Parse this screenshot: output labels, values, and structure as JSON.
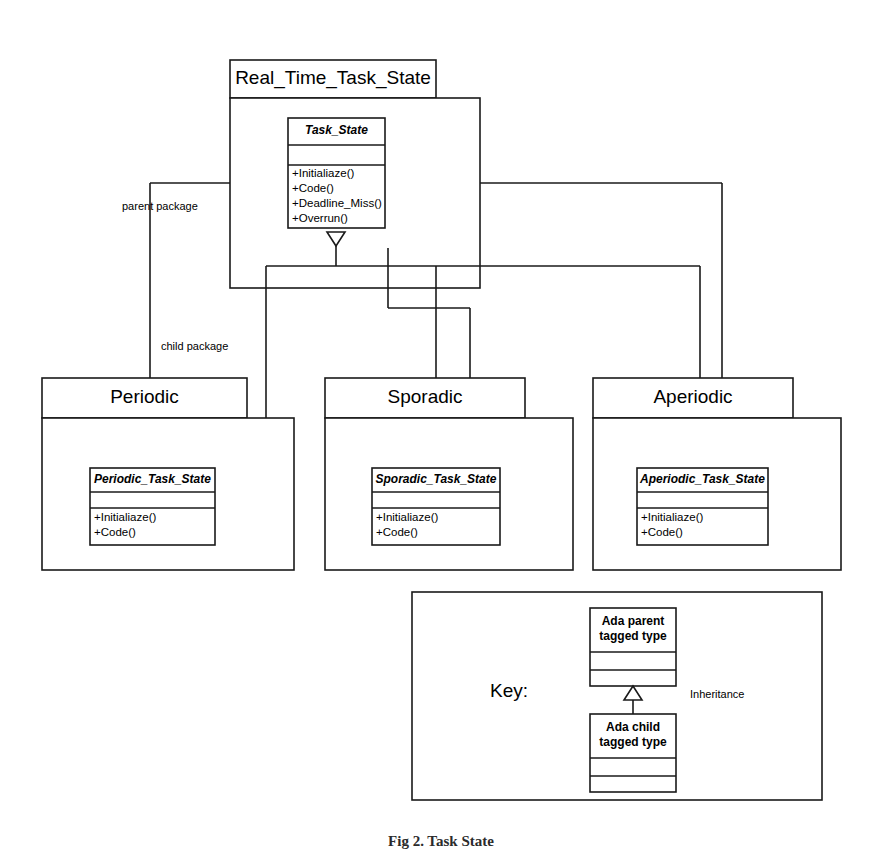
{
  "diagram": {
    "type": "uml-package-class-diagram",
    "caption": "Fig 2. Task State",
    "stroke_color": "#1a1a1a",
    "fill_color": "#ffffff"
  },
  "root_package": {
    "name": "Real_Time_Task_State",
    "classes": [
      {
        "name": "Task_State",
        "attributes": [],
        "operations": [
          "+Initialiaze()",
          "+Code()",
          "+Deadline_Miss()",
          "+Overrun()"
        ]
      }
    ]
  },
  "child_packages": [
    {
      "name": "Periodic",
      "classes": [
        {
          "name": "Periodic_Task_State",
          "attributes": [],
          "operations": [
            "+Initialiaze()",
            "+Code()"
          ]
        }
      ]
    },
    {
      "name": "Sporadic",
      "classes": [
        {
          "name": "Sporadic_Task_State",
          "attributes": [],
          "operations": [
            "+Initialiaze()",
            "+Code()"
          ]
        }
      ]
    },
    {
      "name": "Aperiodic",
      "classes": [
        {
          "name": "Aperiodic_Task_State",
          "attributes": [],
          "operations": [
            "+Initialiaze()",
            "+Code()"
          ]
        }
      ]
    }
  ],
  "edge_labels": {
    "parent_package": "parent package",
    "child_package": "child package"
  },
  "key": {
    "title": "Key:",
    "parent_box": "Ada parent\ntagged type",
    "child_box": "Ada child\ntagged type",
    "relation_label": "Inheritance"
  }
}
